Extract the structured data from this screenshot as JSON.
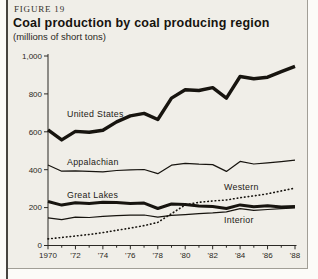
{
  "figure": {
    "label": "FIGURE 19",
    "title": "Coal production by coal producing region",
    "subtitle": "(millions of short tons)"
  },
  "chart_data": {
    "type": "line",
    "title": "Coal production by coal producing region",
    "units": "millions of short tons",
    "grid": false,
    "legend": "inline-labels",
    "line_color": "#17140f",
    "x": [
      1970,
      1971,
      1972,
      1973,
      1974,
      1975,
      1976,
      1977,
      1978,
      1979,
      1980,
      1981,
      1982,
      1983,
      1984,
      1985,
      1986,
      1987,
      1988
    ],
    "x_ticks": [
      1970,
      1972,
      1974,
      1976,
      1978,
      1980,
      1982,
      1984,
      1986,
      1988
    ],
    "x_tick_labels": [
      "1970",
      "'72",
      "'74",
      "'76",
      "'78",
      "'80",
      "'82",
      "'84",
      "'86",
      "'88"
    ],
    "ylim": [
      0,
      1000
    ],
    "y_ticks": [
      0,
      200,
      400,
      600,
      800,
      1000
    ],
    "y_tick_labels": [
      "0",
      "200",
      "400",
      "600",
      "800",
      "1,000"
    ],
    "series": [
      {
        "name": "United States",
        "line_style": "solid-thick",
        "values": [
          610,
          557,
          602,
          598,
          608,
          652,
          684,
          697,
          665,
          778,
          822,
          818,
          833,
          778,
          892,
          880,
          888,
          917,
          945
        ]
      },
      {
        "name": "Appalachian",
        "line_style": "solid-thin",
        "values": [
          425,
          392,
          394,
          391,
          389,
          396,
          399,
          401,
          379,
          424,
          433,
          429,
          427,
          391,
          444,
          430,
          436,
          443,
          450
        ]
      },
      {
        "name": "Great Lakes",
        "line_style": "solid-medium",
        "values": [
          232,
          213,
          226,
          222,
          228,
          227,
          222,
          224,
          195,
          219,
          217,
          209,
          206,
          195,
          214,
          204,
          210,
          203,
          206
        ]
      },
      {
        "name": "Western",
        "line_style": "dotted",
        "values": [
          35,
          42,
          50,
          58,
          68,
          80,
          92,
          105,
          122,
          168,
          214,
          228,
          235,
          240,
          252,
          262,
          273,
          288,
          303
        ]
      },
      {
        "name": "Interior",
        "line_style": "solid-thin",
        "values": [
          146,
          136,
          150,
          148,
          154,
          158,
          160,
          161,
          150,
          159,
          163,
          168,
          172,
          178,
          194,
          186,
          190,
          194,
          199
        ]
      }
    ]
  }
}
